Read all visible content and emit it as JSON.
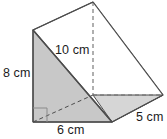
{
  "figure": {
    "name": "triangular-prism",
    "fill_shaded": "#c8c8c8",
    "fill_light": "#ffffff",
    "stroke": "#4d4d4d",
    "stroke_dashed": "#6e6e6e",
    "background": "#ffffff",
    "right_angle_marker": "right-angle",
    "vertices": {
      "front_top": [
        33,
        30
      ],
      "front_bottom_left": [
        33,
        122
      ],
      "front_bottom_right": [
        112,
        122
      ],
      "back_top": [
        93,
        2
      ],
      "back_bottom_right": [
        163,
        95
      ],
      "back_bottom_left": [
        93,
        95
      ]
    }
  },
  "labels": {
    "height": "8 cm",
    "slant": "10 cm",
    "base": "6 cm",
    "depth": "5 cm"
  }
}
